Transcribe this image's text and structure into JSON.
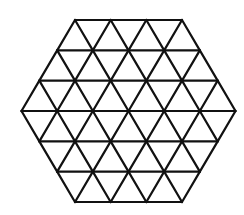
{
  "figure": {
    "title": "",
    "shape": "hexagon",
    "subdivisions_per_side": 3,
    "triangle_count": 54,
    "stroke_color": "#111111",
    "background_color": "#ffffff",
    "stroke_width": 2.2,
    "center": [
      128.5,
      111
    ],
    "side_length_px": 107,
    "row_height_px": 30.33
  }
}
